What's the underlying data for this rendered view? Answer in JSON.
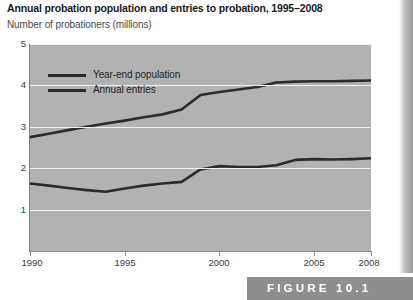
{
  "title": "Annual probation population and entries to probation, 1995–2008",
  "subtitle": "Number of probationers (millions)",
  "figure_label": "FIGURE 10.1",
  "legend": {
    "items": [
      {
        "label": "Year-end population"
      },
      {
        "label": "Annual entries"
      }
    ]
  },
  "axis": {
    "y_ticks": [
      "5",
      "4",
      "3",
      "2",
      "1"
    ],
    "x_ticks": [
      "1990",
      "1995",
      "2000",
      "2005",
      "2008"
    ]
  },
  "colors": {
    "plot_background": "#b2b2b2",
    "gridline": "#f2f2f2",
    "line": "#2b2b2b",
    "axis": "#8a8a8a",
    "figure_bar": "#8e8e8e",
    "title_text": "#1a1a1a",
    "subtitle_text": "#4a4a4a"
  },
  "chart_data": {
    "type": "line",
    "title": "Annual probation population and entries to probation, 1995–2008",
    "subtitle": "Number of probationers (millions)",
    "xlabel": "",
    "ylabel": "Number of probationers (millions)",
    "xlim": [
      1990,
      2008
    ],
    "ylim": [
      0,
      5
    ],
    "yticks": [
      1,
      2,
      3,
      4,
      5
    ],
    "xticks": [
      1990,
      1995,
      2000,
      2005,
      2008
    ],
    "grid": "horizontal",
    "legend_position": "upper-left-inside",
    "x": [
      1990,
      1991,
      1992,
      1993,
      1994,
      1995,
      1996,
      1997,
      1998,
      1999,
      2000,
      2001,
      2002,
      2003,
      2004,
      2005,
      2006,
      2007,
      2008
    ],
    "series": [
      {
        "name": "Year-end population",
        "values": [
          2.75,
          2.83,
          2.92,
          3.0,
          3.08,
          3.15,
          3.23,
          3.3,
          3.42,
          3.77,
          3.84,
          3.9,
          3.96,
          4.07,
          4.09,
          4.1,
          4.1,
          4.11,
          4.12
        ]
      },
      {
        "name": "Annual entries",
        "values": [
          1.63,
          1.58,
          1.52,
          1.47,
          1.43,
          1.51,
          1.58,
          1.63,
          1.67,
          1.97,
          2.05,
          2.03,
          2.03,
          2.07,
          2.2,
          2.22,
          2.21,
          2.22,
          2.24
        ]
      }
    ]
  }
}
